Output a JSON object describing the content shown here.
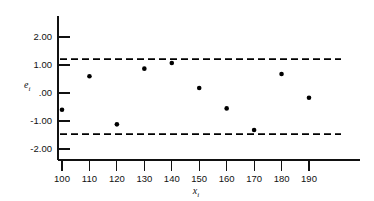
{
  "chart_data": {
    "type": "scatter",
    "title": "",
    "xlabel": "x_i",
    "ylabel": "e_i",
    "xlabel_base": "x",
    "xlabel_sub": "i",
    "ylabel_base": "e",
    "ylabel_sub": "i",
    "x": [
      100,
      110,
      120,
      130,
      140,
      150,
      160,
      170,
      180,
      190
    ],
    "values": [
      -0.6,
      0.6,
      -1.12,
      0.87,
      1.07,
      0.18,
      -0.55,
      -1.32,
      0.68,
      -0.17
    ],
    "series": [
      {
        "name": "residuals",
        "values": [
          -0.6,
          0.6,
          -1.12,
          0.87,
          1.07,
          0.18,
          -0.55,
          -1.32,
          0.68,
          -0.17
        ]
      }
    ],
    "xlim": [
      95,
      195
    ],
    "ylim": [
      -2.55,
      2.55
    ],
    "xticks": [
      100,
      110,
      120,
      130,
      140,
      150,
      160,
      170,
      180,
      190
    ],
    "xtick_labels": [
      "100",
      "110",
      "120",
      "130",
      "140",
      "150",
      "160",
      "170",
      "180",
      "190"
    ],
    "yticks": [
      2.0,
      1.0,
      0.0,
      -1.0,
      -2.0
    ],
    "ytick_labels": [
      "2.00",
      "1.00",
      ".00",
      "-1.00",
      "-2.00"
    ],
    "grid": false,
    "legend": "none",
    "annotations": [
      {
        "name": "upper-control-limit",
        "type": "horizontal-dashed-line",
        "value": 1.21,
        "label": ""
      },
      {
        "name": "lower-control-limit",
        "type": "horizontal-dashed-line",
        "value": -1.47,
        "label": ""
      }
    ],
    "colors": {
      "point": "#000000",
      "axis": "#111111",
      "limit_line": "#000000",
      "background": "#ffffff"
    }
  }
}
